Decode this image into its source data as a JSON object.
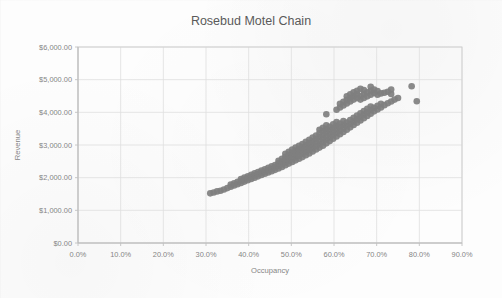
{
  "chart_data": {
    "type": "scatter",
    "title": "Rosebud Motel Chain",
    "xlabel": "Occupancy",
    "ylabel": "Revenue",
    "xlim": [
      0,
      0.9
    ],
    "ylim": [
      0,
      6000
    ],
    "grid": true,
    "legend": "none",
    "marker": {
      "shape": "circle",
      "color": "#7f7f7f",
      "size": 4.4
    },
    "x_tick_labels": [
      "0.0%",
      "10.0%",
      "20.0%",
      "30.0%",
      "40.0%",
      "50.0%",
      "60.0%",
      "70.0%",
      "80.0%",
      "90.0%"
    ],
    "x_tick_values": [
      0,
      0.1,
      0.2,
      0.3,
      0.4,
      0.5,
      0.6,
      0.7,
      0.8,
      0.9
    ],
    "y_tick_labels": [
      "$0.00",
      "$1,000.00",
      "$2,000.00",
      "$3,000.00",
      "$4,000.00",
      "$5,000.00",
      "$6,000.00"
    ],
    "y_tick_values": [
      0,
      1000,
      2000,
      3000,
      4000,
      5000,
      6000
    ],
    "series": [
      {
        "name": "Occupancy vs Revenue",
        "color": "#7f7f7f",
        "points": [
          [
            0.31,
            1520
          ],
          [
            0.318,
            1545
          ],
          [
            0.326,
            1580
          ],
          [
            0.334,
            1600
          ],
          [
            0.342,
            1640
          ],
          [
            0.35,
            1680
          ],
          [
            0.358,
            1720
          ],
          [
            0.358,
            1790
          ],
          [
            0.366,
            1760
          ],
          [
            0.366,
            1830
          ],
          [
            0.374,
            1800
          ],
          [
            0.374,
            1870
          ],
          [
            0.382,
            1840
          ],
          [
            0.382,
            1905
          ],
          [
            0.382,
            1960
          ],
          [
            0.39,
            1880
          ],
          [
            0.39,
            1945
          ],
          [
            0.39,
            2000
          ],
          [
            0.398,
            1920
          ],
          [
            0.398,
            1985
          ],
          [
            0.398,
            2040
          ],
          [
            0.406,
            1960
          ],
          [
            0.406,
            2025
          ],
          [
            0.406,
            2090
          ],
          [
            0.414,
            2000
          ],
          [
            0.414,
            2065
          ],
          [
            0.414,
            2130
          ],
          [
            0.422,
            2040
          ],
          [
            0.422,
            2110
          ],
          [
            0.422,
            2175
          ],
          [
            0.43,
            2080
          ],
          [
            0.43,
            2150
          ],
          [
            0.43,
            2215
          ],
          [
            0.438,
            2120
          ],
          [
            0.438,
            2190
          ],
          [
            0.438,
            2255
          ],
          [
            0.446,
            2160
          ],
          [
            0.446,
            2230
          ],
          [
            0.446,
            2300
          ],
          [
            0.454,
            2200
          ],
          [
            0.454,
            2270
          ],
          [
            0.454,
            2345
          ],
          [
            0.462,
            2240
          ],
          [
            0.462,
            2315
          ],
          [
            0.462,
            2390
          ],
          [
            0.47,
            2280
          ],
          [
            0.47,
            2360
          ],
          [
            0.47,
            2440
          ],
          [
            0.47,
            2520
          ],
          [
            0.478,
            2330
          ],
          [
            0.478,
            2410
          ],
          [
            0.478,
            2495
          ],
          [
            0.478,
            2580
          ],
          [
            0.486,
            2380
          ],
          [
            0.486,
            2465
          ],
          [
            0.486,
            2550
          ],
          [
            0.486,
            2640
          ],
          [
            0.486,
            2730
          ],
          [
            0.494,
            2430
          ],
          [
            0.494,
            2520
          ],
          [
            0.494,
            2610
          ],
          [
            0.494,
            2700
          ],
          [
            0.494,
            2790
          ],
          [
            0.502,
            2480
          ],
          [
            0.502,
            2570
          ],
          [
            0.502,
            2665
          ],
          [
            0.502,
            2760
          ],
          [
            0.502,
            2860
          ],
          [
            0.51,
            2530
          ],
          [
            0.51,
            2625
          ],
          [
            0.51,
            2720
          ],
          [
            0.51,
            2820
          ],
          [
            0.51,
            2920
          ],
          [
            0.518,
            2580
          ],
          [
            0.518,
            2675
          ],
          [
            0.518,
            2775
          ],
          [
            0.518,
            2875
          ],
          [
            0.518,
            2975
          ],
          [
            0.526,
            2630
          ],
          [
            0.526,
            2730
          ],
          [
            0.526,
            2830
          ],
          [
            0.526,
            2930
          ],
          [
            0.526,
            3030
          ],
          [
            0.534,
            2690
          ],
          [
            0.534,
            2790
          ],
          [
            0.534,
            2890
          ],
          [
            0.534,
            2995
          ],
          [
            0.534,
            3100
          ],
          [
            0.542,
            2740
          ],
          [
            0.542,
            2845
          ],
          [
            0.542,
            2950
          ],
          [
            0.542,
            3055
          ],
          [
            0.542,
            3160
          ],
          [
            0.55,
            2800
          ],
          [
            0.55,
            2905
          ],
          [
            0.55,
            3010
          ],
          [
            0.55,
            3115
          ],
          [
            0.55,
            3225
          ],
          [
            0.558,
            2860
          ],
          [
            0.558,
            2965
          ],
          [
            0.558,
            3070
          ],
          [
            0.558,
            3180
          ],
          [
            0.558,
            3290
          ],
          [
            0.566,
            2920
          ],
          [
            0.566,
            3025
          ],
          [
            0.566,
            3135
          ],
          [
            0.566,
            3245
          ],
          [
            0.566,
            3355
          ],
          [
            0.566,
            3465
          ],
          [
            0.574,
            2980
          ],
          [
            0.574,
            3090
          ],
          [
            0.574,
            3200
          ],
          [
            0.574,
            3310
          ],
          [
            0.574,
            3420
          ],
          [
            0.574,
            3530
          ],
          [
            0.582,
            3050
          ],
          [
            0.582,
            3160
          ],
          [
            0.582,
            3270
          ],
          [
            0.582,
            3380
          ],
          [
            0.582,
            3490
          ],
          [
            0.582,
            3600
          ],
          [
            0.582,
            3940
          ],
          [
            0.59,
            3120
          ],
          [
            0.59,
            3230
          ],
          [
            0.59,
            3340
          ],
          [
            0.59,
            3450
          ],
          [
            0.59,
            3560
          ],
          [
            0.598,
            3190
          ],
          [
            0.598,
            3300
          ],
          [
            0.598,
            3410
          ],
          [
            0.598,
            3520
          ],
          [
            0.598,
            3630
          ],
          [
            0.606,
            3260
          ],
          [
            0.606,
            3370
          ],
          [
            0.606,
            3480
          ],
          [
            0.606,
            3590
          ],
          [
            0.606,
            3700
          ],
          [
            0.606,
            4080
          ],
          [
            0.614,
            3330
          ],
          [
            0.614,
            3440
          ],
          [
            0.614,
            3550
          ],
          [
            0.614,
            3660
          ],
          [
            0.614,
            4150
          ],
          [
            0.614,
            4260
          ],
          [
            0.622,
            3400
          ],
          [
            0.622,
            3510
          ],
          [
            0.622,
            3620
          ],
          [
            0.622,
            3730
          ],
          [
            0.622,
            4210
          ],
          [
            0.622,
            4320
          ],
          [
            0.63,
            3470
          ],
          [
            0.63,
            3580
          ],
          [
            0.63,
            3690
          ],
          [
            0.63,
            4270
          ],
          [
            0.63,
            4380
          ],
          [
            0.63,
            4490
          ],
          [
            0.638,
            3540
          ],
          [
            0.638,
            3650
          ],
          [
            0.638,
            3760
          ],
          [
            0.638,
            4330
          ],
          [
            0.638,
            4440
          ],
          [
            0.638,
            4550
          ],
          [
            0.646,
            3610
          ],
          [
            0.646,
            3720
          ],
          [
            0.646,
            3830
          ],
          [
            0.646,
            4390
          ],
          [
            0.646,
            4500
          ],
          [
            0.646,
            4610
          ],
          [
            0.654,
            3680
          ],
          [
            0.654,
            3790
          ],
          [
            0.654,
            3900
          ],
          [
            0.654,
            4440
          ],
          [
            0.654,
            4550
          ],
          [
            0.654,
            4660
          ],
          [
            0.662,
            3750
          ],
          [
            0.662,
            3860
          ],
          [
            0.662,
            3970
          ],
          [
            0.662,
            4390
          ],
          [
            0.662,
            4500
          ],
          [
            0.662,
            4720
          ],
          [
            0.67,
            3820
          ],
          [
            0.67,
            3930
          ],
          [
            0.67,
            4040
          ],
          [
            0.67,
            4440
          ],
          [
            0.67,
            4560
          ],
          [
            0.67,
            4680
          ],
          [
            0.678,
            3890
          ],
          [
            0.678,
            4000
          ],
          [
            0.678,
            4110
          ],
          [
            0.678,
            4490
          ],
          [
            0.678,
            4610
          ],
          [
            0.686,
            3960
          ],
          [
            0.686,
            4070
          ],
          [
            0.686,
            4180
          ],
          [
            0.686,
            4540
          ],
          [
            0.686,
            4660
          ],
          [
            0.686,
            4780
          ],
          [
            0.694,
            4030
          ],
          [
            0.694,
            4140
          ],
          [
            0.694,
            4590
          ],
          [
            0.694,
            4700
          ],
          [
            0.702,
            4090
          ],
          [
            0.702,
            4200
          ],
          [
            0.702,
            4540
          ],
          [
            0.702,
            4650
          ],
          [
            0.71,
            4150
          ],
          [
            0.71,
            4260
          ],
          [
            0.71,
            4580
          ],
          [
            0.718,
            4220
          ],
          [
            0.718,
            4600
          ],
          [
            0.726,
            4280
          ],
          [
            0.726,
            4630
          ],
          [
            0.734,
            4330
          ],
          [
            0.734,
            4560
          ],
          [
            0.734,
            4700
          ],
          [
            0.742,
            4390
          ],
          [
            0.75,
            4440
          ],
          [
            0.782,
            4800
          ],
          [
            0.794,
            4340
          ]
        ]
      }
    ]
  },
  "axes": {
    "title": "Rosebud Motel Chain",
    "x_title": "Occupancy",
    "y_title": "Revenue"
  },
  "colors": {
    "marker": "#7f7f7f",
    "grid": "#dedede",
    "text": "#7b7b7b",
    "title": "#5a5a5a",
    "background": "#fdfdfd"
  }
}
